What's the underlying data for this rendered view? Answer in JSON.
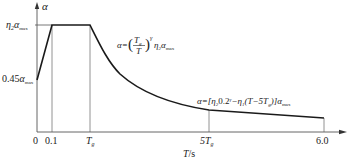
{
  "diagram": {
    "type": "seismic-influence-coefficient-curve",
    "y_axis_label": "α",
    "x_axis_label": "T/s",
    "y_ticks": {
      "plateau": "η₂α_max",
      "start": "0.45α_max"
    },
    "x_ticks": [
      "0",
      "0.1",
      "T_g",
      "5T_g",
      "6.0"
    ],
    "formulas": {
      "descending_curve": "α=(T_g/T)^γ η₂α_max",
      "linear_segment": "α=[η₂0.2^γ−η₁(T−5T_g)]α_max"
    },
    "segments": [
      {
        "name": "rising-linear",
        "from": "0",
        "to": "0.1",
        "value_from": "0.45α_max",
        "value_to": "η₂α_max"
      },
      {
        "name": "plateau",
        "from": "0.1",
        "to": "T_g",
        "value": "η₂α_max"
      },
      {
        "name": "curve-decay",
        "from": "T_g",
        "to": "5T_g"
      },
      {
        "name": "linear-decay",
        "from": "5T_g",
        "to": "6.0"
      }
    ],
    "colors": {
      "curve": "#1a1a1a",
      "axis": "#555555",
      "guides": "#777777"
    }
  },
  "labels": {
    "y_axis": "α",
    "x_axis_T": "T",
    "x_axis_unit": "/s",
    "tick_0": "0",
    "tick_01": "0.1",
    "tick_Tg_T": "T",
    "tick_Tg_sub": "g",
    "tick_5Tg_5T": "5T",
    "tick_5Tg_sub": "g",
    "tick_60": "6.0",
    "plateau_eta": "η",
    "plateau_sub2": "2",
    "plateau_alpha": "α",
    "plateau_max": "max",
    "start_045": "0.45",
    "start_alpha": "α",
    "start_max": "max",
    "f1_alpha_eq": "α=",
    "f1_Tg_T": "T",
    "f1_Tg_sub": "g",
    "f1_den_T": "T",
    "f1_gamma": "γ",
    "f1_eta": "η",
    "f1_sub2": "2",
    "f1_alpha": "α",
    "f1_max": "max",
    "f2_main": "α=[η",
    "f2_sub2": "2",
    "f2_mid": "0.2",
    "f2_gamma": "γ",
    "f2_minus": "−η",
    "f2_sub1": "1",
    "f2_paren": "(T−5T",
    "f2_subg": "g",
    "f2_close": ")]α",
    "f2_max": "max"
  }
}
